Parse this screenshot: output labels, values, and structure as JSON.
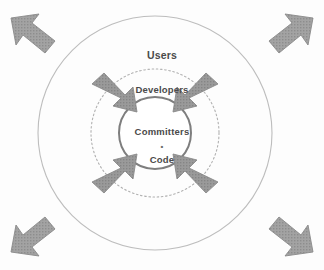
{
  "diagram": {
    "type": "concentric-rings-with-arrows",
    "title": "",
    "background_color": "#fdfdfd",
    "center": {
      "x": 155,
      "y": 133
    },
    "rings": [
      {
        "id": "outer",
        "label": "Users",
        "radius": 117,
        "stroke": "#b9b9b9",
        "stroke_width": 1,
        "style": "solid",
        "fill": "none",
        "label_color": "#4a4a4a"
      },
      {
        "id": "middle",
        "label": "Developers",
        "radius": 64,
        "stroke": "#b0b0b0",
        "stroke_width": 1,
        "style": "dotted",
        "fill": "none",
        "label_color": "#4a4a4a"
      },
      {
        "id": "inner",
        "label": "Committers",
        "sub_label": "Code",
        "separator": "•",
        "radius": 36,
        "stroke": "#7e7e7e",
        "stroke_width": 2,
        "style": "solid",
        "fill": "#ffffff",
        "label_color": "#4a4a4a"
      }
    ],
    "inward_arrows": {
      "count": 4,
      "direction": "inward",
      "fill": "#9a9a9a",
      "stroke": "#8a8a8a",
      "texture": "hatched",
      "positions": [
        "top-left",
        "top-right",
        "bottom-left",
        "bottom-right"
      ]
    },
    "outward_arrows": {
      "count": 4,
      "direction": "outward",
      "fill": "#a0a0a0",
      "stroke": "#8a8a8a",
      "texture": "hatched",
      "positions": [
        "top-left",
        "top-right",
        "bottom-left",
        "bottom-right"
      ]
    }
  },
  "labels": {
    "users": "Users",
    "developers": "Developers",
    "committers": "Committers",
    "separator": "•",
    "code": "Code"
  }
}
